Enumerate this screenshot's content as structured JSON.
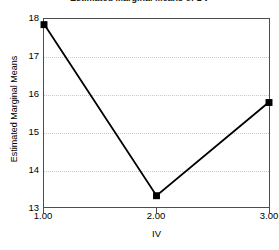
{
  "chart_data": {
    "type": "line",
    "title": "Estimated Marginal Means of DV",
    "xlabel": "IV",
    "ylabel": "Estimated Marginal Means",
    "x": [
      1.0,
      2.0,
      3.0
    ],
    "xticklabels": [
      "1.00",
      "2.00",
      "3.00"
    ],
    "values": [
      17.85,
      13.3,
      15.78
    ],
    "yticklabels": [
      "18",
      "17",
      "16",
      "15",
      "14",
      "13"
    ],
    "yticks": [
      18,
      17,
      16,
      15,
      14,
      13
    ],
    "ylim": [
      13,
      18
    ],
    "xlim": [
      1,
      3
    ],
    "grid": "horizontal-dotted",
    "legend": "none",
    "marker": "square",
    "line_color": "#000000",
    "marker_color": "#000000",
    "grid_color": "#c8c8c8",
    "frame_color": "#4d4d4d",
    "background": "#ffffff"
  }
}
